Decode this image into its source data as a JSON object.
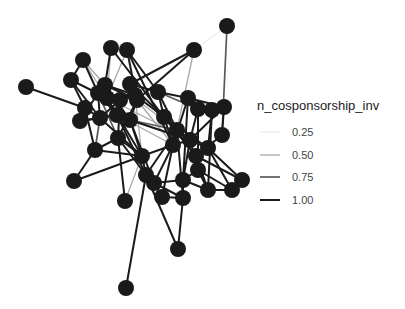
{
  "chart_data": {
    "type": "network",
    "title": "",
    "xlabel": "",
    "ylabel": "",
    "grid": false,
    "legend_position": "right",
    "legend": {
      "title": "n_cosponsorship_inv",
      "entries": [
        {
          "label": "0.25",
          "value": 0.25,
          "color": "#e6e6e6",
          "width": 1.0
        },
        {
          "label": "0.50",
          "value": 0.5,
          "color": "#a8a8a8",
          "width": 1.3
        },
        {
          "label": "0.75",
          "value": 0.75,
          "color": "#5a5a5a",
          "width": 1.7
        },
        {
          "label": "1.00",
          "value": 1.0,
          "color": "#1a1a1a",
          "width": 2.0
        }
      ]
    },
    "node_color": "#1a1a1a",
    "node_radius": 8,
    "nodes": [
      {
        "id": 0,
        "x": 227,
        "y": 26
      },
      {
        "id": 1,
        "x": 194,
        "y": 50
      },
      {
        "id": 2,
        "x": 111,
        "y": 48
      },
      {
        "id": 3,
        "x": 127,
        "y": 50
      },
      {
        "id": 4,
        "x": 83,
        "y": 60
      },
      {
        "id": 5,
        "x": 71,
        "y": 80
      },
      {
        "id": 6,
        "x": 26,
        "y": 87
      },
      {
        "id": 7,
        "x": 105,
        "y": 85
      },
      {
        "id": 8,
        "x": 130,
        "y": 84
      },
      {
        "id": 9,
        "x": 158,
        "y": 92
      },
      {
        "id": 10,
        "x": 137,
        "y": 100
      },
      {
        "id": 11,
        "x": 107,
        "y": 98
      },
      {
        "id": 12,
        "x": 98,
        "y": 93
      },
      {
        "id": 13,
        "x": 85,
        "y": 108
      },
      {
        "id": 14,
        "x": 80,
        "y": 121
      },
      {
        "id": 15,
        "x": 100,
        "y": 118
      },
      {
        "id": 16,
        "x": 117,
        "y": 115
      },
      {
        "id": 17,
        "x": 130,
        "y": 120
      },
      {
        "id": 18,
        "x": 164,
        "y": 117
      },
      {
        "id": 19,
        "x": 188,
        "y": 98
      },
      {
        "id": 20,
        "x": 198,
        "y": 109
      },
      {
        "id": 21,
        "x": 212,
        "y": 110
      },
      {
        "id": 22,
        "x": 224,
        "y": 107
      },
      {
        "id": 23,
        "x": 222,
        "y": 135
      },
      {
        "id": 24,
        "x": 177,
        "y": 130
      },
      {
        "id": 25,
        "x": 173,
        "y": 145
      },
      {
        "id": 26,
        "x": 190,
        "y": 140
      },
      {
        "id": 27,
        "x": 208,
        "y": 148
      },
      {
        "id": 28,
        "x": 196,
        "y": 156
      },
      {
        "id": 29,
        "x": 198,
        "y": 170
      },
      {
        "id": 30,
        "x": 118,
        "y": 138
      },
      {
        "id": 31,
        "x": 95,
        "y": 150
      },
      {
        "id": 32,
        "x": 74,
        "y": 181
      },
      {
        "id": 33,
        "x": 142,
        "y": 156
      },
      {
        "id": 34,
        "x": 146,
        "y": 175
      },
      {
        "id": 35,
        "x": 154,
        "y": 183
      },
      {
        "id": 36,
        "x": 162,
        "y": 197
      },
      {
        "id": 37,
        "x": 183,
        "y": 198
      },
      {
        "id": 38,
        "x": 183,
        "y": 180
      },
      {
        "id": 39,
        "x": 208,
        "y": 190
      },
      {
        "id": 40,
        "x": 232,
        "y": 190
      },
      {
        "id": 41,
        "x": 242,
        "y": 180
      },
      {
        "id": 42,
        "x": 125,
        "y": 201
      },
      {
        "id": 43,
        "x": 178,
        "y": 249
      },
      {
        "id": 44,
        "x": 126,
        "y": 288
      },
      {
        "id": 45,
        "x": 135,
        "y": 95
      },
      {
        "id": 46,
        "x": 120,
        "y": 100
      }
    ],
    "edges": [
      [
        0,
        1,
        0.25
      ],
      [
        0,
        23,
        0.75
      ],
      [
        1,
        8,
        1.0
      ],
      [
        1,
        10,
        1.0
      ],
      [
        1,
        24,
        0.5
      ],
      [
        2,
        7,
        1.0
      ],
      [
        2,
        18,
        1.0
      ],
      [
        3,
        9,
        1.0
      ],
      [
        3,
        25,
        1.0
      ],
      [
        3,
        11,
        0.5
      ],
      [
        4,
        5,
        1.0
      ],
      [
        4,
        12,
        1.0
      ],
      [
        4,
        16,
        0.5
      ],
      [
        5,
        13,
        1.0
      ],
      [
        5,
        11,
        1.0
      ],
      [
        5,
        15,
        1.0
      ],
      [
        6,
        13,
        1.0
      ],
      [
        7,
        12,
        1.0
      ],
      [
        7,
        10,
        1.0
      ],
      [
        7,
        17,
        1.0
      ],
      [
        8,
        18,
        1.0
      ],
      [
        8,
        9,
        1.0
      ],
      [
        9,
        18,
        1.0
      ],
      [
        9,
        24,
        1.0
      ],
      [
        9,
        20,
        0.75
      ],
      [
        10,
        17,
        1.0
      ],
      [
        10,
        25,
        0.5
      ],
      [
        10,
        30,
        1.0
      ],
      [
        11,
        16,
        1.0
      ],
      [
        11,
        26,
        0.5
      ],
      [
        11,
        33,
        1.0
      ],
      [
        12,
        15,
        1.0
      ],
      [
        12,
        30,
        0.75
      ],
      [
        13,
        15,
        1.0
      ],
      [
        13,
        31,
        1.0
      ],
      [
        14,
        15,
        1.0
      ],
      [
        14,
        16,
        1.0
      ],
      [
        15,
        33,
        1.0
      ],
      [
        16,
        17,
        1.0
      ],
      [
        16,
        34,
        1.0
      ],
      [
        16,
        25,
        0.5
      ],
      [
        17,
        33,
        1.0
      ],
      [
        17,
        26,
        1.0
      ],
      [
        17,
        35,
        1.0
      ],
      [
        18,
        24,
        1.0
      ],
      [
        18,
        27,
        1.0
      ],
      [
        18,
        28,
        1.0
      ],
      [
        19,
        20,
        1.0
      ],
      [
        19,
        25,
        1.0
      ],
      [
        19,
        38,
        1.0
      ],
      [
        20,
        21,
        1.0
      ],
      [
        20,
        26,
        1.0
      ],
      [
        20,
        29,
        1.0
      ],
      [
        21,
        22,
        1.0
      ],
      [
        21,
        27,
        1.0
      ],
      [
        21,
        39,
        1.0
      ],
      [
        22,
        23,
        1.0
      ],
      [
        22,
        26,
        1.0
      ],
      [
        23,
        28,
        1.0
      ],
      [
        24,
        25,
        1.0
      ],
      [
        24,
        34,
        1.0
      ],
      [
        24,
        37,
        1.0
      ],
      [
        25,
        26,
        1.0
      ],
      [
        25,
        35,
        1.0
      ],
      [
        25,
        36,
        1.0
      ],
      [
        26,
        27,
        1.0
      ],
      [
        26,
        38,
        1.0
      ],
      [
        27,
        28,
        1.0
      ],
      [
        27,
        40,
        1.0
      ],
      [
        27,
        41,
        1.0
      ],
      [
        28,
        29,
        1.0
      ],
      [
        28,
        39,
        1.0
      ],
      [
        28,
        41,
        1.0
      ],
      [
        29,
        40,
        1.0
      ],
      [
        29,
        38,
        1.0
      ],
      [
        30,
        31,
        1.0
      ],
      [
        30,
        33,
        1.0
      ],
      [
        30,
        42,
        1.0
      ],
      [
        31,
        32,
        1.0
      ],
      [
        31,
        33,
        1.0
      ],
      [
        32,
        33,
        1.0
      ],
      [
        33,
        34,
        1.0
      ],
      [
        33,
        42,
        0.5
      ],
      [
        34,
        35,
        1.0
      ],
      [
        34,
        44,
        1.0
      ],
      [
        34,
        43,
        1.0
      ],
      [
        35,
        36,
        1.0
      ],
      [
        35,
        37,
        1.0
      ],
      [
        36,
        37,
        1.0
      ],
      [
        37,
        38,
        1.0
      ],
      [
        37,
        43,
        1.0
      ],
      [
        38,
        39,
        1.0
      ],
      [
        39,
        40,
        1.0
      ],
      [
        40,
        41,
        1.0
      ],
      [
        45,
        46,
        1.0
      ],
      [
        45,
        8,
        1.0
      ],
      [
        46,
        12,
        1.0
      ],
      [
        45,
        18,
        1.0
      ],
      [
        46,
        15,
        1.0
      ],
      [
        7,
        45,
        1.0
      ],
      [
        12,
        16,
        1.0
      ],
      [
        4,
        7,
        0.5
      ],
      [
        14,
        12,
        1.0
      ],
      [
        2,
        11,
        0.5
      ],
      [
        3,
        10,
        1.0
      ],
      [
        45,
        33,
        0.5
      ],
      [
        46,
        30,
        1.0
      ],
      [
        24,
        26,
        1.0
      ],
      [
        18,
        25,
        1.0
      ],
      [
        9,
        19,
        1.0
      ],
      [
        19,
        22,
        1.0
      ],
      [
        35,
        38,
        1.0
      ],
      [
        29,
        39,
        1.0
      ],
      [
        26,
        29,
        1.0
      ],
      [
        33,
        25,
        1.0
      ],
      [
        17,
        24,
        0.75
      ],
      [
        10,
        26,
        0.5
      ],
      [
        16,
        27,
        0.5
      ],
      [
        30,
        34,
        1.0
      ],
      [
        15,
        31,
        0.75
      ]
    ]
  },
  "figure": {
    "width": 405,
    "height": 309,
    "background": "#ffffff"
  }
}
